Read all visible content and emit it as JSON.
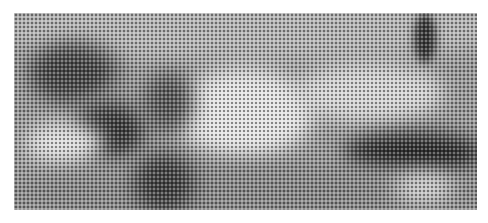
{
  "image": {
    "description": "Halftone-dithered grayscale photograph of a person lying on a surface",
    "style": "halftone",
    "tones": {
      "background": "#ffffff",
      "light": "#e6e6e6",
      "mid": "#9a9a9a",
      "dark": "#3a3a3a"
    }
  }
}
